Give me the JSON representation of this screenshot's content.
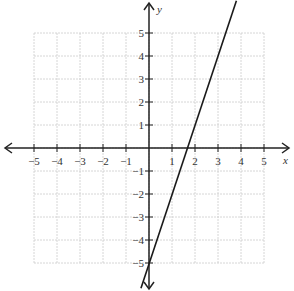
{
  "chart_data": {
    "type": "line",
    "title": "",
    "xlabel": "x",
    "ylabel": "y",
    "xlim": [
      -5,
      5
    ],
    "ylim": [
      -5,
      5
    ],
    "grid": true,
    "x_ticks": [
      -5,
      -4,
      -3,
      -2,
      -1,
      1,
      2,
      3,
      4,
      5
    ],
    "y_ticks": [
      5,
      4,
      3,
      2,
      1,
      -1,
      -2,
      -3,
      -4,
      -5
    ],
    "x_tick_labels": [
      "−5",
      "−4",
      "−3",
      "−2",
      "−1",
      "1",
      "2",
      "3",
      "4",
      "5"
    ],
    "y_tick_labels": [
      "5",
      "4",
      "3",
      "2",
      "1",
      "−1",
      "−2",
      "−3",
      "−4",
      "−5"
    ],
    "series": [
      {
        "name": "line",
        "equation": "y = 3x - 5",
        "slope": 3,
        "intercept": -5,
        "points": [
          [
            -0.35,
            -6.1
          ],
          [
            0,
            -5
          ],
          [
            1,
            -2
          ],
          [
            2,
            1
          ],
          [
            3,
            4
          ],
          [
            3.8,
            6.4
          ]
        ]
      }
    ],
    "colors": {
      "line": "#1a1a1a",
      "axis": "#222222",
      "grid": "#cccccc"
    }
  }
}
